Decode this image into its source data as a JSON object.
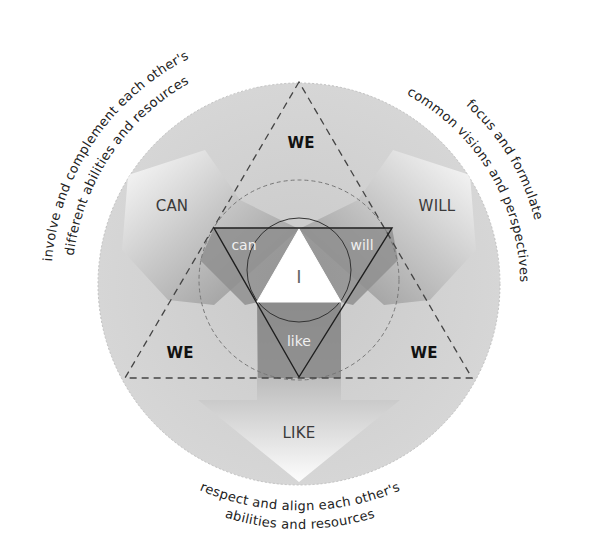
{
  "diagram": {
    "center_label": "I",
    "inner_labels": {
      "can": "can",
      "will": "will",
      "like": "like"
    },
    "outer_labels": {
      "can": "CAN",
      "will": "WILL",
      "like": "LIKE"
    },
    "we_labels": {
      "top": "WE",
      "bottom_left": "WE",
      "bottom_right": "WE"
    },
    "captions": {
      "can_line1": "involve and complement each other's",
      "can_line2": "different abilities and resources",
      "will_line1": "focus and formulate",
      "will_line2": "common visions and perspectives",
      "like_line1": "respect and align each other's",
      "like_line2": "abilities and resources"
    },
    "colors": {
      "disc": "#d2d2d2",
      "arm_dark": "#8e8e8e",
      "arm_light": "#ffffff",
      "center_triangle": "#ffffff",
      "line": "#222222",
      "dash": "#555555"
    }
  }
}
